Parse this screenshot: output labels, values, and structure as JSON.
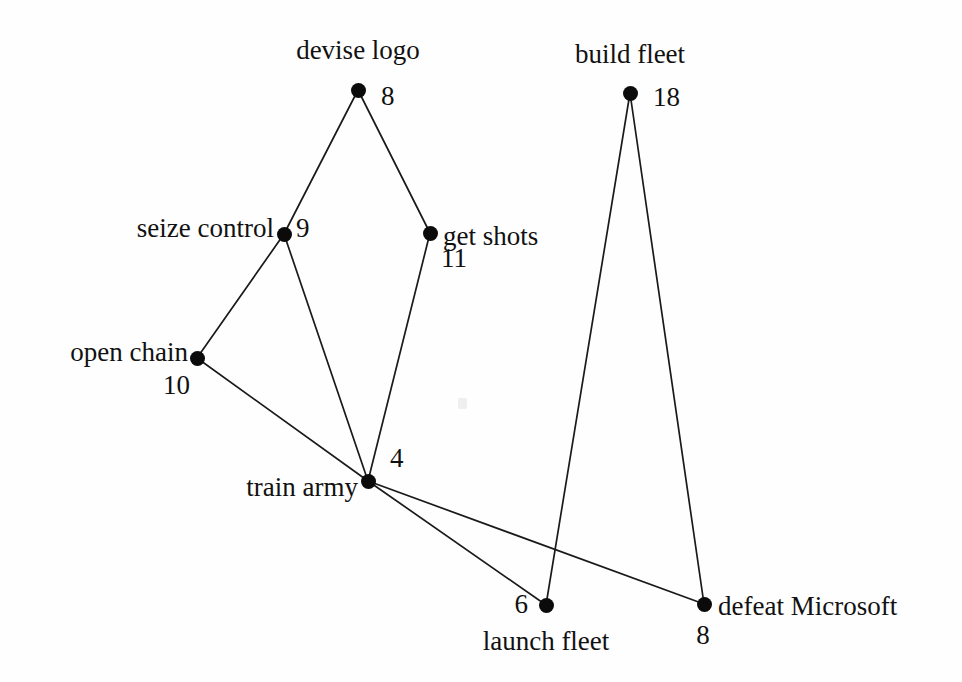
{
  "diagram": {
    "background_color": "#fefefe",
    "node_color": "#0b0b0b",
    "edge_color": "#1a1a1a",
    "width": 962,
    "height": 682
  },
  "nodes": [
    {
      "id": "devise-logo",
      "label": "devise logo",
      "weight": "8",
      "x": 358,
      "y": 90,
      "label_x": 358,
      "label_y": 50,
      "label_align": "center",
      "weight_x": 381,
      "weight_y": 96,
      "weight_align": "right"
    },
    {
      "id": "build-fleet",
      "label": "build fleet",
      "weight": "18",
      "x": 630,
      "y": 93,
      "label_x": 630,
      "label_y": 54,
      "label_align": "center",
      "weight_x": 653,
      "weight_y": 97,
      "weight_align": "right"
    },
    {
      "id": "seize-control",
      "label": "seize control",
      "weight": "9",
      "x": 284,
      "y": 234,
      "label_x": 274,
      "label_y": 228,
      "label_align": "left",
      "weight_x": 296,
      "weight_y": 228,
      "weight_align": "right"
    },
    {
      "id": "get-shots",
      "label": "get shots",
      "weight": "11",
      "x": 430,
      "y": 233,
      "label_x": 443,
      "label_y": 236,
      "label_align": "right",
      "weight_x": 441,
      "weight_y": 258,
      "weight_align": "right"
    },
    {
      "id": "open-chain",
      "label": "open chain",
      "weight": "10",
      "x": 197,
      "y": 358,
      "label_x": 188,
      "label_y": 352,
      "label_align": "left",
      "weight_x": 190,
      "weight_y": 385,
      "weight_align": "left"
    },
    {
      "id": "train-army",
      "label": "train army",
      "weight": "4",
      "x": 368,
      "y": 481,
      "label_x": 358,
      "label_y": 487,
      "label_align": "left",
      "weight_x": 390,
      "weight_y": 458,
      "weight_align": "right"
    },
    {
      "id": "launch-fleet",
      "label": "launch fleet",
      "weight": "6",
      "x": 546,
      "y": 605,
      "label_x": 546,
      "label_y": 641,
      "label_align": "center",
      "weight_x": 528,
      "weight_y": 604,
      "weight_align": "left"
    },
    {
      "id": "defeat-microsoft",
      "label": "defeat Microsoft",
      "weight": "8",
      "x": 704,
      "y": 604,
      "label_x": 718,
      "label_y": 606,
      "label_align": "right",
      "weight_x": 703,
      "weight_y": 635,
      "weight_align": "center"
    }
  ],
  "edges": [
    {
      "id": "devise-logo--seize-control",
      "from": "devise logo",
      "to": "seize control",
      "x1": 358,
      "y1": 90,
      "x2": 284,
      "y2": 234
    },
    {
      "id": "devise-logo--get-shots",
      "from": "devise logo",
      "to": "get shots",
      "x1": 358,
      "y1": 90,
      "x2": 430,
      "y2": 233
    },
    {
      "id": "seize-control--open-chain",
      "from": "seize control",
      "to": "open chain",
      "x1": 284,
      "y1": 234,
      "x2": 197,
      "y2": 358
    },
    {
      "id": "seize-control--train-army",
      "from": "seize control",
      "to": "train army",
      "x1": 284,
      "y1": 234,
      "x2": 368,
      "y2": 481
    },
    {
      "id": "get-shots--train-army",
      "from": "get shots",
      "to": "train army",
      "x1": 430,
      "y1": 233,
      "x2": 368,
      "y2": 481
    },
    {
      "id": "open-chain--train-army",
      "from": "open chain",
      "to": "train army",
      "x1": 197,
      "y1": 358,
      "x2": 368,
      "y2": 481
    },
    {
      "id": "train-army--launch-fleet",
      "from": "train army",
      "to": "launch fleet",
      "x1": 368,
      "y1": 481,
      "x2": 546,
      "y2": 605
    },
    {
      "id": "train-army--defeat-microsoft",
      "from": "train army",
      "to": "defeat Microsoft",
      "x1": 368,
      "y1": 481,
      "x2": 704,
      "y2": 604
    },
    {
      "id": "build-fleet--launch-fleet",
      "from": "build fleet",
      "to": "launch fleet",
      "x1": 630,
      "y1": 93,
      "x2": 546,
      "y2": 605
    },
    {
      "id": "build-fleet--defeat-microsoft",
      "from": "build fleet",
      "to": "defeat Microsoft",
      "x1": 630,
      "y1": 93,
      "x2": 704,
      "y2": 604
    }
  ]
}
